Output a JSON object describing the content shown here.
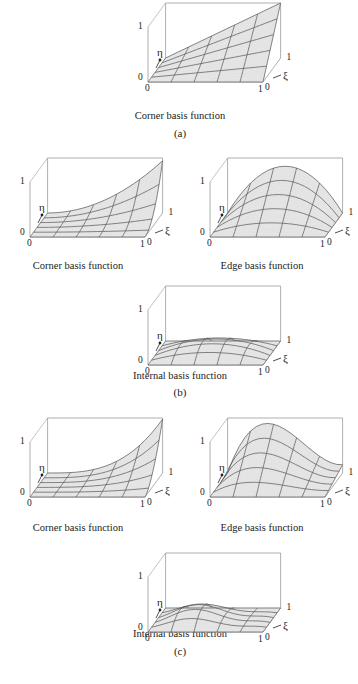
{
  "figure": {
    "panels": [
      {
        "id": "a",
        "label": "(a)",
        "label_pos": [
          180,
          133
        ]
      },
      {
        "id": "b",
        "label": "(b)",
        "label_pos": [
          180,
          392
        ]
      },
      {
        "id": "c",
        "label": "(c)",
        "label_pos": [
          180,
          650
        ]
      }
    ],
    "plots": [
      {
        "name": "plot-a-corner",
        "caption": "Corner basis function",
        "type": "corner-linear",
        "origin": [
          118,
          0
        ],
        "caption_pos": [
          180,
          112
        ]
      },
      {
        "name": "plot-b-corner",
        "caption": "Corner basis function",
        "type": "corner-quad",
        "origin": [
          0,
          155
        ],
        "caption_pos": [
          80,
          263
        ]
      },
      {
        "name": "plot-b-edge",
        "caption": "Edge basis function",
        "type": "edge-quad",
        "origin": [
          180,
          155
        ],
        "caption_pos": [
          262,
          263
        ]
      },
      {
        "name": "plot-b-internal",
        "caption": "Internal basis function",
        "type": "internal-quad",
        "origin": [
          118,
          283
        ],
        "caption_pos": [
          180,
          372
        ]
      },
      {
        "name": "plot-c-corner",
        "caption": "Corner basis function",
        "type": "corner-cubic",
        "origin": [
          0,
          415
        ],
        "caption_pos": [
          80,
          522
        ]
      },
      {
        "name": "plot-c-edge",
        "caption": "Edge basis function",
        "type": "edge-cubic",
        "origin": [
          180,
          415
        ],
        "caption_pos": [
          262,
          522
        ]
      },
      {
        "name": "plot-c-internal",
        "caption": "Internal basis function",
        "type": "internal-cubic",
        "origin": [
          118,
          550
        ],
        "caption_pos": [
          180,
          630
        ]
      }
    ],
    "axes": {
      "z_tick_top": "1",
      "z_tick_bottom": "0",
      "x_tick_left": "0",
      "x_tick_right": "1",
      "y_tick_front": "0",
      "y_tick_back": "1",
      "eta_label": "η",
      "xi_label": "ξ"
    },
    "colors": {
      "surface": "#e3e3e3",
      "grid": "#555555",
      "box": "#9a9a9a"
    }
  }
}
